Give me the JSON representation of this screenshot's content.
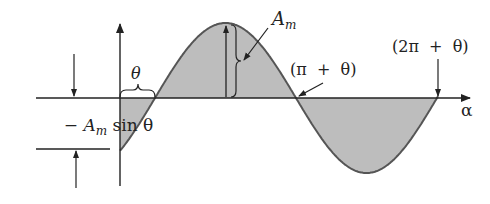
{
  "diagram": {
    "colors": {
      "fill": "#bdbdbd",
      "curve": "#555555",
      "line": "#222222",
      "background": "#ffffff"
    },
    "labels": {
      "amplitude_main": "A",
      "amplitude_sub": "m",
      "theta": "θ",
      "pi_plus_theta": "(π  +  θ)",
      "two_pi_plus_theta": "(2π  +  θ)",
      "alpha": "α",
      "neg_prefix": "− ",
      "neg_A": "A",
      "neg_sub": "m",
      "neg_sin": " sin θ"
    },
    "geometry": {
      "axis_y": 98,
      "axis_x_start": 36,
      "axis_x_end": 472,
      "vertical_axis_x": 120,
      "vertical_axis_top": 22,
      "vertical_axis_bottom": 186,
      "amplitude_px": 75,
      "theta_x": 155,
      "period_px": 282,
      "curve_start_x": 120,
      "curve_end_x": 438
    }
  }
}
